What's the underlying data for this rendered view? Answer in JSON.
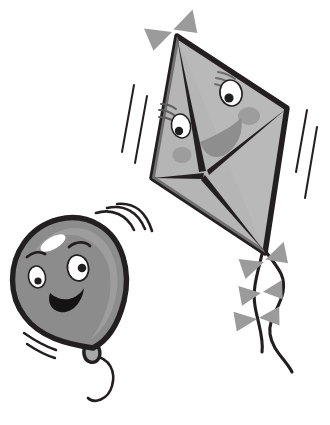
{
  "illustration": {
    "title": "Cartoon balloon and kite",
    "background_color": "#ffffff",
    "canvas": {
      "width": 330,
      "height": 425
    }
  },
  "palette": {
    "background": "#ffffff",
    "outline_dark": "#231f20",
    "kite_fill": "#b9b9b9",
    "kite_fill_shadow": "#adadad",
    "kite_cheek": "#999999",
    "kite_mouth": "#8e8e8e",
    "bow_fill": "#9b9b9b",
    "balloon_fill": "#8c8c8c",
    "balloon_shade": "#a2a2a2",
    "balloon_highlight": "#ffffff",
    "eye_white": "#ffffff",
    "pupil": "#231f20",
    "mouth_dark": "#151314",
    "motion_line": "#231f20"
  },
  "objects": {
    "kite": {
      "name": "kite",
      "label": "Smiling kite",
      "fill": "#b9b9b9",
      "outline": "#231f20",
      "corners": {
        "top": [
          177,
          36
        ],
        "left": [
          152,
          178
        ],
        "right": [
          287,
          108
        ],
        "bottom": [
          265,
          253
        ]
      },
      "face": {
        "eyes": [
          {
            "name": "kite-eye-left",
            "cx": 181,
            "cy": 126,
            "rx": 10,
            "ry": 12,
            "pupil_cx": 178,
            "pupil_cy": 130,
            "pupil_r": 4.2
          },
          {
            "name": "kite-eye-right",
            "cx": 231,
            "cy": 92,
            "rx": 11,
            "ry": 13,
            "pupil_cx": 229,
            "pupil_cy": 97,
            "pupil_r": 4.6
          }
        ],
        "lashes_count": 3,
        "cheeks": [
          {
            "name": "kite-cheek-left",
            "cx": 182,
            "cy": 155,
            "rx": 9,
            "ry": 8
          },
          {
            "name": "kite-cheek-right",
            "cx": 248,
            "cy": 116,
            "rx": 11,
            "ry": 9
          }
        ],
        "mouth": {
          "name": "kite-mouth",
          "fill": "#8e8e8e"
        }
      },
      "bows": [
        {
          "name": "kite-bow-top",
          "cx": 172,
          "cy": 32,
          "angle": -18
        },
        {
          "name": "kite-tail-bow-1",
          "cx": 265,
          "cy": 262,
          "angle": -16
        },
        {
          "name": "kite-tail-bow-2",
          "cx": 262,
          "cy": 292,
          "angle": -4
        },
        {
          "name": "kite-tail-bow-3",
          "cx": 258,
          "cy": 318,
          "angle": -4
        }
      ],
      "tail_string": {
        "name": "kite-tail-string",
        "color": "#231f20"
      }
    },
    "balloon": {
      "name": "balloon",
      "label": "Smiling balloon",
      "fill": "#8c8c8c",
      "outline": "#231f20",
      "center": [
        78,
        279
      ],
      "radius_x": 52,
      "radius_y": 56,
      "face": {
        "eyes": [
          {
            "name": "balloon-eye-left",
            "cx": 37,
            "cy": 276,
            "rx": 8,
            "ry": 11,
            "pupil_cx": 38,
            "pupil_cy": 280,
            "pupil_r": 3.6
          },
          {
            "name": "balloon-eye-right",
            "cx": 77,
            "cy": 268,
            "rx": 10,
            "ry": 13,
            "pupil_cx": 81,
            "pupil_cy": 268,
            "pupil_r": 4.2
          }
        ],
        "brows_count": 2,
        "mouth": {
          "name": "balloon-mouth",
          "fill": "#151314"
        }
      },
      "highlight": {
        "name": "balloon-highlight",
        "cx": 52,
        "cy": 243,
        "rx": 13,
        "ry": 6,
        "angle": -28
      },
      "knot": {
        "name": "balloon-knot",
        "cx": 93,
        "cy": 352
      },
      "string": {
        "name": "balloon-string",
        "color": "#231f20"
      }
    },
    "motion_lines": {
      "kite_left": {
        "name": "motion-lines-kite-left",
        "count": 2
      },
      "kite_right": {
        "name": "motion-lines-kite-right",
        "count": 2
      },
      "balloon_top": {
        "name": "motion-lines-balloon-top",
        "count": 3
      },
      "balloon_bottom": {
        "name": "motion-lines-balloon-bottom",
        "count": 2
      }
    }
  }
}
